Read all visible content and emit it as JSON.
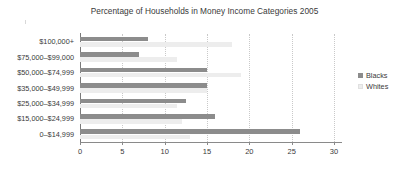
{
  "chart_data": {
    "type": "bar",
    "orientation": "horizontal",
    "title": "Percentage of Households in Money Income Categories 2005",
    "xlabel": "",
    "ylabel": "",
    "xlim": [
      0,
      30
    ],
    "xticks": [
      0,
      5,
      10,
      15,
      20,
      25,
      30
    ],
    "xtick_labels": [
      "0",
      "5",
      "10",
      "15",
      "20",
      "25",
      "30"
    ],
    "grid": true,
    "grid_axis": "x",
    "legend_position": "right",
    "categories": [
      "$100,000+",
      "$75,000–$99,000",
      "$50,000–$74,999",
      "$35,000–$49,999",
      "$25,000–$34,999",
      "$15,000–$24,999",
      "0–$14,999"
    ],
    "series": [
      {
        "name": "Blacks",
        "color": "#8c8c8c",
        "values": [
          8,
          7,
          15,
          15,
          12.5,
          16,
          26
        ]
      },
      {
        "name": "Whites",
        "color": "#ededed",
        "values": [
          18,
          11.5,
          19,
          15,
          11.5,
          12,
          13
        ]
      }
    ]
  },
  "legend": {
    "items": [
      {
        "label": "Blacks"
      },
      {
        "label": "Whites"
      }
    ]
  }
}
